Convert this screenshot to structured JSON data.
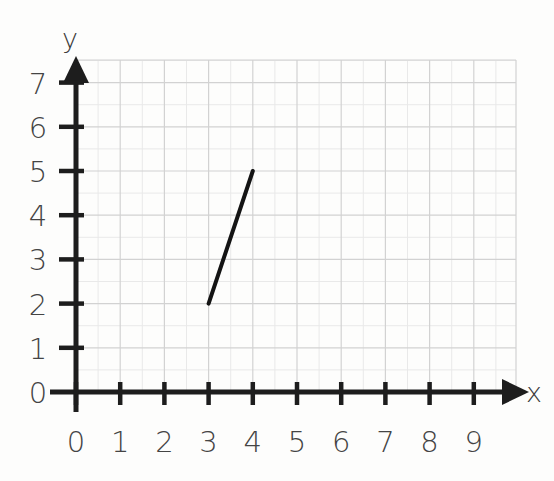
{
  "chart_data": {
    "type": "line",
    "title": "",
    "xlabel": "x",
    "ylabel": "y",
    "grid": true,
    "legend": "none",
    "xlim": [
      0,
      9
    ],
    "ylim": [
      0,
      7
    ],
    "x_ticks": [
      "0",
      "1",
      "2",
      "3",
      "4",
      "5",
      "6",
      "7",
      "8",
      "9"
    ],
    "y_ticks": [
      "0",
      "1",
      "2",
      "3",
      "4",
      "5",
      "6",
      "7"
    ],
    "series": [
      {
        "name": "segment",
        "points": [
          {
            "x": 3,
            "y": 2
          },
          {
            "x": 4,
            "y": 5
          }
        ]
      }
    ],
    "annotations": []
  },
  "axes": {
    "x_label": "x",
    "y_label": "y",
    "x_arrow": "arrow-right-icon",
    "y_arrow": "arrow-up-icon"
  },
  "colors": {
    "background": "#fdfdfc",
    "axis": "#1d1d1d",
    "grid_major": "#d2d2d2",
    "grid_minor": "#e9e9e9",
    "segment": "#141414",
    "label": "#444444"
  }
}
